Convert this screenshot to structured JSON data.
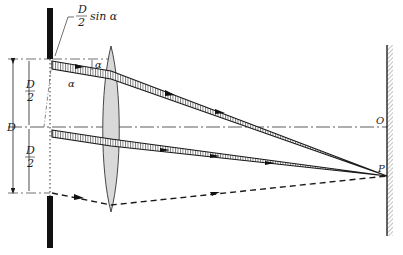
{
  "diagram": {
    "labels": {
      "top_annotation_num": "D",
      "top_annotation_den": "2",
      "top_annotation_func": "sin α",
      "alpha_top": "α",
      "alpha_left": "α",
      "half_width_upper_num": "D",
      "half_width_upper_den": "2",
      "half_width_lower_num": "D",
      "half_width_lower_den": "2",
      "full_width": "D",
      "point_O": "O",
      "point_P": "P"
    },
    "colors": {
      "line": "#1a1a1a",
      "lens_fill": "#d9d9d9",
      "beam_fill": "#cfcfcf",
      "screen_hatch": "#555555"
    }
  }
}
